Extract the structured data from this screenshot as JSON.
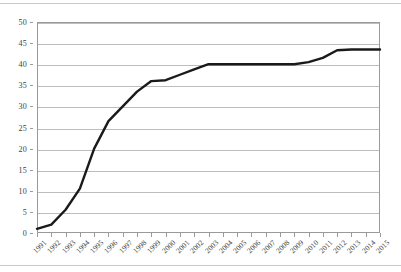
{
  "document": {
    "rule_top": "horizontal-rule",
    "rule_bottom": "horizontal-rule"
  },
  "chart_data": {
    "type": "line",
    "title": "",
    "subtitle": "",
    "xlabel": "",
    "ylabel": "",
    "legend": [],
    "legend_position": "none",
    "grid": true,
    "grid_axis": "y",
    "line_color": "#1a1a1a",
    "line_width": 2.4,
    "markers": false,
    "xlim": [
      1991,
      2015
    ],
    "ylim": [
      0,
      50
    ],
    "yticks": [
      0,
      5,
      10,
      15,
      20,
      25,
      30,
      35,
      40,
      45,
      50
    ],
    "ytick_labels": [
      "0",
      "5",
      "10",
      "15",
      "20",
      "25",
      "30",
      "35",
      "40",
      "45",
      "50"
    ],
    "xticks": [
      1991,
      1992,
      1993,
      1994,
      1995,
      1996,
      1997,
      1998,
      1999,
      2000,
      2001,
      2002,
      2003,
      2004,
      2005,
      2006,
      2007,
      2008,
      2009,
      2010,
      2011,
      2012,
      2013,
      2014,
      2015
    ],
    "xtick_labels": [
      "1991",
      "1992",
      "1993",
      "1994",
      "1995",
      "1996",
      "1997",
      "1998",
      "1999",
      "2000",
      "2001",
      "2002",
      "2003",
      "2004",
      "2005",
      "2006",
      "2007",
      "2008",
      "2009",
      "2010",
      "2011",
      "2012",
      "2013",
      "2014",
      "2015"
    ],
    "xtick_rotation": -45,
    "categories": [
      "1991",
      "1992",
      "1993",
      "1994",
      "1995",
      "1996",
      "1997",
      "1998",
      "1999",
      "2000",
      "2001",
      "2002",
      "2003",
      "2004",
      "2005",
      "2006",
      "2007",
      "2008",
      "2009",
      "2010",
      "2011",
      "2012",
      "2013",
      "2014",
      "2015"
    ],
    "values": [
      1,
      2,
      5.5,
      10.5,
      20,
      26.5,
      30,
      33.5,
      36,
      36.2,
      37.5,
      38.8,
      40,
      40,
      40,
      40,
      40,
      40,
      40,
      40.5,
      41.5,
      43.3,
      43.5,
      43.5,
      43.5
    ]
  }
}
